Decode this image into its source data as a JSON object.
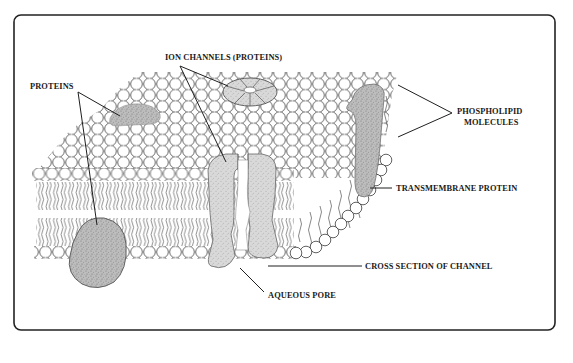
{
  "diagram": {
    "labels": {
      "ion_channels": "ION CHANNELS (PROTEINS)",
      "proteins": "PROTEINS",
      "phospholipid_line1": "PHOSPHOLIPID",
      "phospholipid_line2": "MOLECULES",
      "transmembrane_protein": "TRANSMEMBRANE PROTEIN",
      "cross_section": "CROSS SECTION OF CHANNEL",
      "aqueous_pore": "AQUEOUS PORE"
    },
    "components": [
      "phospholipid-bilayer",
      "ion-channel-top-view",
      "ion-channel-cross-section",
      "surface-protein",
      "embedded-protein",
      "transmembrane-protein",
      "aqueous-pore"
    ],
    "colors": {
      "frame": "#222222",
      "protein_fill": "#c9c9c9",
      "protein_dark": "#9a9a9a",
      "channel_fill": "#d6d6d6",
      "lipid_head": "#ffffff",
      "text": "#1a1a1a"
    }
  }
}
